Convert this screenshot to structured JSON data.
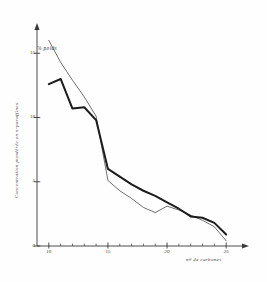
{
  "chart_data": {
    "type": "line",
    "title": "",
    "subtitle": "",
    "xlabel": "n# de carbones",
    "ylabel": "Concentration pondérée en n-paraffines",
    "annotation": "% poids",
    "xlim": [
      9,
      26
    ],
    "ylim": [
      0,
      16.5
    ],
    "xticks": [
      10,
      15,
      20,
      25
    ],
    "xtick_labels": [
      "10",
      "15",
      "20",
      "25"
    ],
    "yticks": [
      0,
      5,
      10,
      15
    ],
    "ytick_labels": [
      "0",
      "5",
      "10",
      "15"
    ],
    "minor_xticks": [
      11,
      12,
      13,
      14,
      16,
      17,
      18,
      19,
      21,
      22,
      23,
      24
    ],
    "grid": false,
    "legend": "none",
    "axis_color": "#3a3a3a",
    "series": [
      {
        "name": "thin-curve",
        "style": "thin",
        "color": "#4a4a4a",
        "width": 0.8,
        "x": [
          10,
          11,
          12,
          13,
          14,
          15,
          16,
          17,
          18,
          19,
          20,
          21,
          22,
          23,
          24,
          25
        ],
        "values": [
          16.0,
          14.3,
          12.9,
          11.6,
          10.1,
          5.1,
          4.3,
          3.7,
          3.0,
          2.6,
          3.1,
          2.8,
          2.4,
          2.0,
          1.5,
          0.4
        ]
      },
      {
        "name": "thick-curve",
        "style": "thick",
        "color": "#1c1c1c",
        "width": 2.0,
        "x": [
          10,
          11,
          12,
          13,
          14,
          15,
          16,
          17,
          18,
          19,
          20,
          21,
          22,
          23,
          24,
          25
        ],
        "values": [
          12.6,
          13.0,
          10.7,
          10.8,
          9.8,
          6.0,
          5.4,
          4.8,
          4.3,
          3.9,
          3.4,
          2.9,
          2.3,
          2.2,
          1.8,
          0.9
        ]
      }
    ]
  }
}
